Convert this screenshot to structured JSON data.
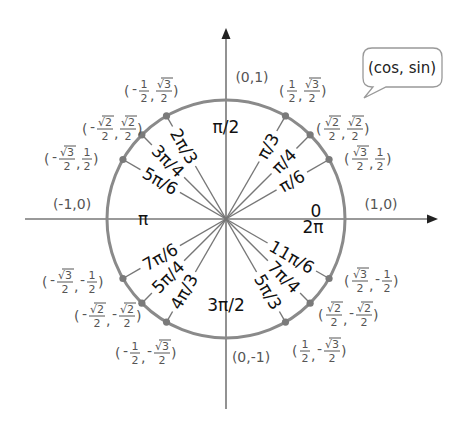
{
  "diagram": {
    "colors": {
      "circle": "#8a8a8a",
      "axes": "#777777",
      "rays": "#777777",
      "points": "#7a7a7a",
      "angle_text": "#111111",
      "coord_text": "#555555",
      "background": "#ffffff"
    },
    "bubble": {
      "text": "(cos, sin)"
    },
    "axis_points": [
      {
        "id": "east",
        "deg": 0,
        "coord": "(1,0)",
        "angle_top": "0",
        "angle_bottom": "2π"
      },
      {
        "id": "north",
        "deg": 90,
        "coord": "(0,1)",
        "angle": "π/2"
      },
      {
        "id": "west",
        "deg": 180,
        "coord": "(-1,0)",
        "angle": "π"
      },
      {
        "id": "south",
        "deg": 270,
        "coord": "(0,-1)",
        "angle": "3π/2"
      }
    ],
    "points": [
      {
        "deg": 30,
        "angle": "π/6",
        "cos": {
          "sign": "",
          "num": "√3",
          "den": "2"
        },
        "sin": {
          "sign": "",
          "num": "1",
          "den": "2"
        }
      },
      {
        "deg": 45,
        "angle": "π/4",
        "cos": {
          "sign": "",
          "num": "√2",
          "den": "2"
        },
        "sin": {
          "sign": "",
          "num": "√2",
          "den": "2"
        }
      },
      {
        "deg": 60,
        "angle": "π/3",
        "cos": {
          "sign": "",
          "num": "1",
          "den": "2"
        },
        "sin": {
          "sign": "",
          "num": "√3",
          "den": "2"
        }
      },
      {
        "deg": 120,
        "angle": "2π/3",
        "cos": {
          "sign": "-",
          "num": "1",
          "den": "2"
        },
        "sin": {
          "sign": "",
          "num": "√3",
          "den": "2"
        }
      },
      {
        "deg": 135,
        "angle": "3π/4",
        "cos": {
          "sign": "-",
          "num": "√2",
          "den": "2"
        },
        "sin": {
          "sign": "",
          "num": "√2",
          "den": "2"
        }
      },
      {
        "deg": 150,
        "angle": "5π/6",
        "cos": {
          "sign": "-",
          "num": "√3",
          "den": "2"
        },
        "sin": {
          "sign": "",
          "num": "1",
          "den": "2"
        }
      },
      {
        "deg": 210,
        "angle": "7π/6",
        "cos": {
          "sign": "-",
          "num": "√3",
          "den": "2"
        },
        "sin": {
          "sign": "-",
          "num": "1",
          "den": "2"
        }
      },
      {
        "deg": 225,
        "angle": "5π/4",
        "cos": {
          "sign": "-",
          "num": "√2",
          "den": "2"
        },
        "sin": {
          "sign": "-",
          "num": "√2",
          "den": "2"
        }
      },
      {
        "deg": 240,
        "angle": "4π/3",
        "cos": {
          "sign": "-",
          "num": "1",
          "den": "2"
        },
        "sin": {
          "sign": "-",
          "num": "√3",
          "den": "2"
        }
      },
      {
        "deg": 300,
        "angle": "5π/3",
        "cos": {
          "sign": "",
          "num": "1",
          "den": "2"
        },
        "sin": {
          "sign": "-",
          "num": "√3",
          "den": "2"
        }
      },
      {
        "deg": 315,
        "angle": "7π/4",
        "cos": {
          "sign": "",
          "num": "√2",
          "den": "2"
        },
        "sin": {
          "sign": "-",
          "num": "√2",
          "den": "2"
        }
      },
      {
        "deg": 330,
        "angle": "11π/6",
        "cos": {
          "sign": "",
          "num": "√3",
          "den": "2"
        },
        "sin": {
          "sign": "-",
          "num": "1",
          "den": "2"
        }
      }
    ]
  }
}
